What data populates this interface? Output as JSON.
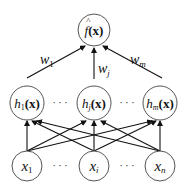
{
  "diagram": {
    "type": "neural-network",
    "output_node": {
      "label_main": "f",
      "label_hat": "^",
      "label_arg": "(x)",
      "x": 94,
      "y": 30
    },
    "hidden_nodes": [
      {
        "label_main": "h",
        "sub": "1",
        "arg": "(x)",
        "x": 27,
        "y": 103
      },
      {
        "label_main": "h",
        "sub": "j",
        "arg": "(x)",
        "x": 94,
        "y": 103
      },
      {
        "label_main": "h",
        "sub": "m",
        "arg": "(x)",
        "x": 160,
        "y": 103
      }
    ],
    "input_nodes": [
      {
        "label_main": "x",
        "sub": "1",
        "x": 27,
        "y": 166
      },
      {
        "label_main": "x",
        "sub": "i",
        "x": 94,
        "y": 166
      },
      {
        "label_main": "x",
        "sub": "n",
        "x": 160,
        "y": 166
      }
    ],
    "weights": [
      {
        "label_main": "w",
        "sub": "1"
      },
      {
        "label_main": "w",
        "sub": "j"
      },
      {
        "label_main": "w",
        "sub": "m"
      }
    ],
    "ellipsis": "·  ·  ·"
  }
}
